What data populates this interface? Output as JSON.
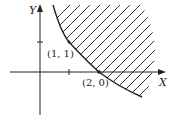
{
  "diagram": {
    "axes": {
      "x_label": "X",
      "y_label": "Y"
    },
    "points": [
      {
        "label": "(1, 1)",
        "x": 1,
        "y": 1
      },
      {
        "label": "(2, 0)",
        "x": 2,
        "y": 0
      }
    ],
    "region": {
      "description": "Shaded region above/right of a decreasing convex curve passing through (1, 1) and (2, 0)",
      "hatch_color": "#333333"
    },
    "colors": {
      "line": "#222222",
      "background": "#ffffff"
    }
  }
}
